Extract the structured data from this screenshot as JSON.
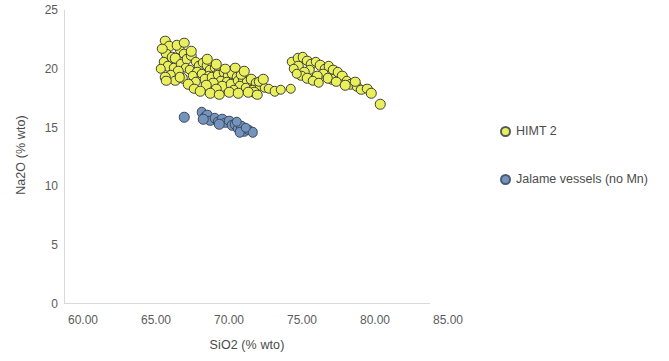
{
  "chart_data": {
    "type": "scatter",
    "title": "",
    "xlabel": "SiO2 (% wto)",
    "ylabel": "Na2O (% wto)",
    "xlim": [
      60.0,
      85.0
    ],
    "ylim": [
      0,
      25
    ],
    "xticks": [
      "60.00",
      "65.00",
      "70.00",
      "75.00",
      "80.00",
      "85.00"
    ],
    "yticks": [
      "0",
      "5",
      "10",
      "15",
      "20",
      "25"
    ],
    "grid": false,
    "legend_position": "right",
    "series": [
      {
        "name": "HIMT 2",
        "color": "#e9f05c",
        "edge_color": "#3f3f35",
        "points": [
          [
            66.9,
            22.4
          ],
          [
            67.2,
            21.9
          ],
          [
            67.0,
            21.3
          ],
          [
            67.4,
            21.0
          ],
          [
            66.8,
            20.6
          ],
          [
            67.6,
            20.9
          ],
          [
            67.9,
            21.6
          ],
          [
            68.2,
            21.3
          ],
          [
            67.1,
            20.2
          ],
          [
            66.6,
            20.0
          ],
          [
            67.5,
            20.1
          ],
          [
            68.0,
            20.4
          ],
          [
            68.4,
            20.8
          ],
          [
            68.7,
            21.1
          ],
          [
            69.0,
            20.6
          ],
          [
            68.3,
            20.1
          ],
          [
            67.8,
            19.8
          ],
          [
            67.3,
            19.5
          ],
          [
            66.9,
            19.3
          ],
          [
            68.6,
            19.9
          ],
          [
            69.2,
            20.2
          ],
          [
            69.5,
            20.5
          ],
          [
            69.8,
            20.3
          ],
          [
            69.1,
            19.7
          ],
          [
            68.8,
            19.4
          ],
          [
            68.1,
            19.2
          ],
          [
            67.6,
            19.0
          ],
          [
            69.4,
            19.6
          ],
          [
            70.0,
            19.9
          ],
          [
            70.3,
            20.1
          ],
          [
            70.6,
            19.8
          ],
          [
            69.9,
            19.4
          ],
          [
            69.6,
            19.1
          ],
          [
            69.0,
            18.9
          ],
          [
            68.5,
            18.7
          ],
          [
            70.1,
            19.3
          ],
          [
            70.5,
            19.5
          ],
          [
            70.9,
            19.7
          ],
          [
            71.2,
            19.4
          ],
          [
            70.7,
            19.0
          ],
          [
            70.2,
            18.8
          ],
          [
            69.7,
            18.6
          ],
          [
            71.5,
            19.6
          ],
          [
            71.8,
            19.3
          ],
          [
            71.1,
            18.9
          ],
          [
            70.8,
            18.5
          ],
          [
            70.4,
            18.3
          ],
          [
            71.4,
            18.7
          ],
          [
            71.9,
            19.0
          ],
          [
            72.2,
            19.2
          ],
          [
            72.5,
            18.9
          ],
          [
            72.0,
            18.5
          ],
          [
            71.6,
            18.2
          ],
          [
            72.8,
            19.1
          ],
          [
            73.1,
            18.8
          ],
          [
            72.4,
            18.4
          ],
          [
            72.9,
            18.2
          ],
          [
            73.4,
            18.6
          ],
          [
            73.7,
            18.4
          ],
          [
            73.0,
            18.0
          ],
          [
            68.9,
            18.3
          ],
          [
            69.3,
            18.1
          ],
          [
            70.0,
            17.9
          ],
          [
            70.6,
            17.8
          ],
          [
            71.3,
            18.0
          ],
          [
            71.9,
            17.9
          ],
          [
            72.6,
            18.0
          ],
          [
            73.2,
            17.8
          ],
          [
            66.7,
            21.7
          ],
          [
            67.7,
            22.0
          ],
          [
            68.2,
            22.2
          ],
          [
            67.0,
            19.0
          ],
          [
            74.0,
            18.3
          ],
          [
            74.4,
            18.1
          ],
          [
            73.3,
            18.9
          ],
          [
            72.1,
            19.5
          ],
          [
            71.0,
            20.0
          ],
          [
            69.8,
            20.8
          ],
          [
            68.7,
            21.5
          ],
          [
            67.9,
            19.3
          ],
          [
            70.4,
            20.4
          ],
          [
            71.7,
            20.1
          ],
          [
            72.3,
            19.8
          ],
          [
            73.6,
            19.1
          ],
          [
            74.8,
            18.2
          ],
          [
            75.5,
            18.3
          ],
          [
            75.6,
            20.6
          ],
          [
            76.0,
            20.9
          ],
          [
            76.3,
            21.0
          ],
          [
            76.6,
            20.7
          ],
          [
            76.0,
            20.2
          ],
          [
            75.7,
            20.0
          ],
          [
            76.9,
            20.4
          ],
          [
            77.2,
            20.6
          ],
          [
            77.5,
            20.3
          ],
          [
            76.8,
            19.9
          ],
          [
            76.4,
            19.7
          ],
          [
            77.8,
            20.0
          ],
          [
            78.1,
            20.2
          ],
          [
            78.4,
            19.9
          ],
          [
            77.7,
            19.6
          ],
          [
            77.3,
            19.4
          ],
          [
            78.7,
            19.7
          ],
          [
            79.0,
            19.4
          ],
          [
            78.3,
            19.1
          ],
          [
            79.3,
            19.0
          ],
          [
            79.6,
            18.7
          ],
          [
            80.0,
            18.5
          ],
          [
            80.3,
            18.2
          ],
          [
            79.9,
            18.9
          ],
          [
            80.7,
            18.3
          ],
          [
            81.0,
            17.9
          ],
          [
            81.6,
            17.0
          ],
          [
            76.2,
            19.4
          ],
          [
            76.6,
            19.2
          ],
          [
            77.0,
            19.0
          ],
          [
            77.4,
            18.8
          ],
          [
            75.9,
            19.6
          ],
          [
            78.0,
            19.2
          ],
          [
            78.6,
            18.9
          ],
          [
            79.2,
            18.6
          ]
        ]
      },
      {
        "name": "Jalame vessels (no Mn)",
        "color": "#7494c0",
        "edge_color": "#3c4656",
        "points": [
          [
            68.2,
            15.9
          ],
          [
            69.4,
            16.3
          ],
          [
            69.6,
            15.9
          ],
          [
            69.8,
            16.1
          ],
          [
            70.0,
            15.6
          ],
          [
            70.3,
            15.8
          ],
          [
            70.5,
            15.5
          ],
          [
            70.8,
            15.7
          ],
          [
            71.0,
            15.4
          ],
          [
            71.3,
            15.6
          ],
          [
            71.5,
            15.2
          ],
          [
            71.7,
            15.3
          ],
          [
            71.9,
            14.9
          ],
          [
            72.1,
            15.1
          ],
          [
            72.3,
            14.7
          ],
          [
            72.6,
            14.8
          ],
          [
            72.9,
            14.6
          ],
          [
            69.5,
            15.7
          ],
          [
            70.6,
            15.3
          ],
          [
            71.8,
            15.5
          ],
          [
            72.0,
            14.6
          ],
          [
            72.4,
            15.0
          ]
        ]
      }
    ]
  },
  "legend": {
    "items": [
      {
        "label": "HIMT 2",
        "marker": "circle-marker-yellow"
      },
      {
        "label": "Jalame vessels (no Mn)",
        "marker": "circle-marker-blue"
      }
    ]
  }
}
